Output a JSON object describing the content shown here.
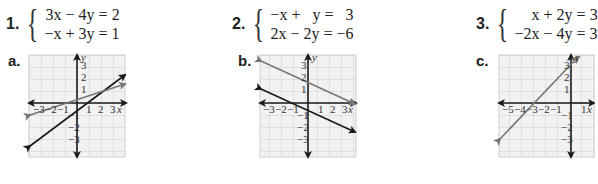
{
  "problems": [
    {
      "number": "1.",
      "equations": [
        "3x − 4y = 2",
        "−x + 3y = 1"
      ]
    },
    {
      "number": "2.",
      "equations": [
        "−x +   y =   3",
        "2x − 2y = −6"
      ]
    },
    {
      "number": "3.",
      "equations": [
        "x + 2y = 3",
        "−2x − 4y = 3"
      ]
    }
  ],
  "graphs": [
    {
      "label": "a.",
      "x_ticks": [
        "−3",
        "−2",
        "−1",
        "1",
        "2",
        "3"
      ],
      "y_ticks": [
        "3",
        "2",
        "1",
        "−1",
        "−2",
        "−3"
      ],
      "x_axis": "x",
      "y_axis": "y"
    },
    {
      "label": "b.",
      "x_ticks": [
        "−3",
        "−2",
        "−1",
        "1",
        "2",
        "3"
      ],
      "y_ticks": [
        "3",
        "2",
        "1",
        "−1",
        "−2",
        "−3"
      ],
      "x_axis": "x",
      "y_axis": "y"
    },
    {
      "label": "c.",
      "x_ticks": [
        "−5",
        "−4",
        "−3",
        "−2",
        "−1",
        "1"
      ],
      "y_ticks": [
        "3",
        "2",
        "1",
        "−1",
        "−2",
        "−3"
      ],
      "x_axis": "x",
      "y_axis": "y"
    }
  ],
  "colors": {
    "grid": "#cfcfcf",
    "grid_bg": "#f2f2f2",
    "dark_line": "#1a1a1a",
    "gray_line": "#777777"
  }
}
